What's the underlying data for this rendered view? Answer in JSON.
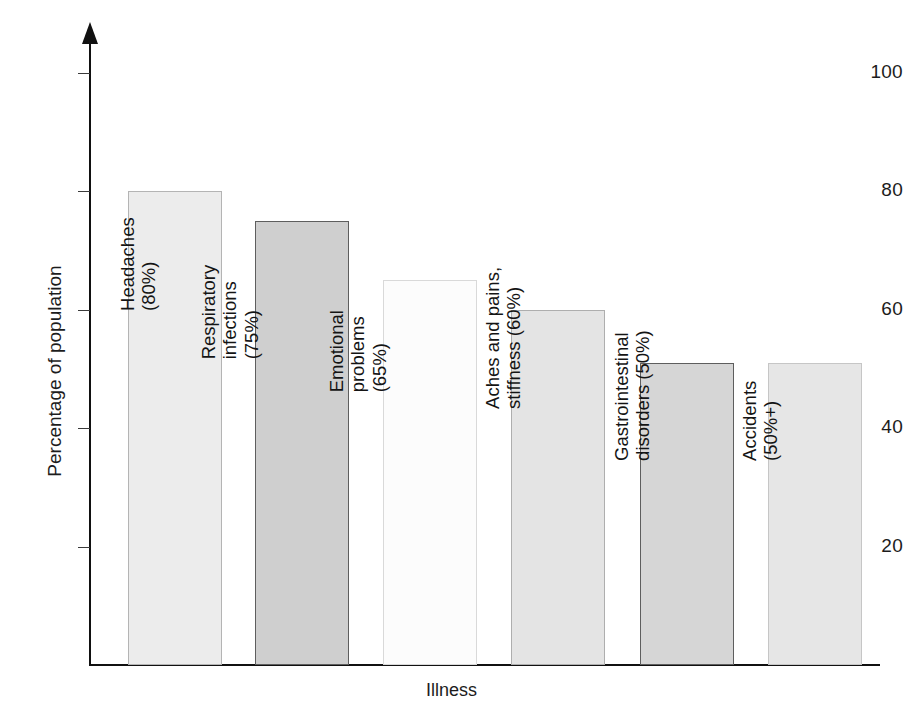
{
  "chart_data": {
    "type": "bar",
    "title": "",
    "xlabel": "Illness",
    "ylabel": "Percentage of population",
    "ylim": [
      0,
      105
    ],
    "grid": false,
    "legend": null,
    "yticks": [
      20,
      40,
      60,
      80,
      100
    ],
    "ytick_labels": [
      "20",
      "40",
      "60",
      "80",
      "100"
    ],
    "categories": [
      "Headaches",
      "Respiratory infections",
      "Emotional problems",
      "Aches and pains, stiffness",
      "Gastrointestinal disorders",
      "Accidents"
    ],
    "values": [
      80,
      75,
      65,
      60,
      51,
      51
    ],
    "annotations": [
      "Headaches (80%)",
      "Respiratory infections (75%)",
      "Emotional problems (65%)",
      "Aches and pains, stiffness (60%)",
      "Gastrointestinal disorders (50%)",
      "Accidents (50%+)"
    ],
    "bars": [
      {
        "category": "Headaches",
        "value": 80,
        "label_lines": [
          "Headaches",
          "(80%)"
        ],
        "fill": "#ececec",
        "stroke": "#b4b4b4",
        "x": 128,
        "width": 94,
        "label_x": 160,
        "label_y": 268
      },
      {
        "category": "Respiratory infections",
        "value": 75,
        "label_lines": [
          "Respiratory",
          "infections",
          "(75%)"
        ],
        "fill": "#cfcfcf",
        "stroke": "#5e5e5e",
        "x": 255,
        "width": 94,
        "label_x": 262,
        "label_y": 295
      },
      {
        "category": "Emotional problems",
        "value": 65,
        "label_lines": [
          "Emotional",
          "problems",
          "(65%)"
        ],
        "fill": "#fcfcfc",
        "stroke": "#d9d9d9",
        "x": 383,
        "width": 94,
        "label_x": 390,
        "label_y": 328
      },
      {
        "category": "Aches and pains, stiffness",
        "value": 60,
        "label_lines": [
          "Aches and pains,",
          "stiffness (60%)"
        ],
        "fill": "#e4e4e4",
        "stroke": "#aeaeae",
        "x": 511,
        "width": 94,
        "label_x": 525,
        "label_y": 366
      },
      {
        "category": "Gastrointestinal disorders",
        "value": 51,
        "label_lines": [
          "Gastrointestinal",
          "disorders (50%)"
        ],
        "fill": "#d6d6d6",
        "stroke": "#5e5e5e",
        "x": 640,
        "width": 94,
        "label_x": 654,
        "label_y": 418
      },
      {
        "category": "Accidents",
        "value": 51,
        "label_lines": [
          "Accidents",
          "(50%+)"
        ],
        "fill": "#e6e6e6",
        "stroke": "#c6c6c6",
        "x": 768,
        "width": 94,
        "label_x": 782,
        "label_y": 418
      }
    ]
  },
  "figure": {
    "caption": ""
  },
  "colors": {
    "axis": "#111111",
    "text": "#1c1c1c",
    "background": "#ffffff"
  }
}
